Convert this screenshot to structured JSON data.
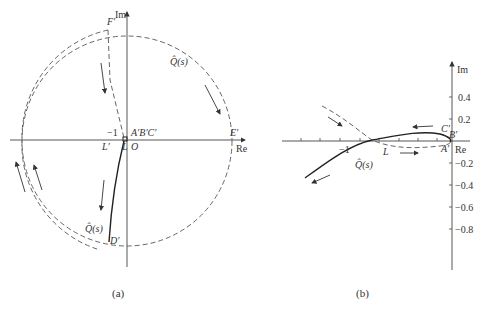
{
  "panel_a": {
    "axis_re": "Re",
    "axis_im": "Im",
    "tick_minus_one": "−1",
    "points": {
      "F": "F′",
      "E": "E′",
      "ABC": "A′B′C′",
      "L_prime": "L′",
      "L": "L",
      "O": "O",
      "D": "D′"
    },
    "curve_label_top": "Q̂(s)",
    "curve_label_bottom": "Q̂(s)",
    "caption": "(a)"
  },
  "panel_b": {
    "axis_re": "Re",
    "axis_im": "Im",
    "x_tick": "−1",
    "y_ticks": [
      "0.4",
      "0.2",
      "−0.2",
      "−0.4",
      "−0.6",
      "−0.8"
    ],
    "points": {
      "C": "C′",
      "B": "B′",
      "A": "A′",
      "L": "L"
    },
    "curve_label": "Q̂(s)",
    "caption": "(b)"
  },
  "colors": {
    "line": "#333333",
    "dashed": "#555555",
    "axis": "#444444"
  }
}
